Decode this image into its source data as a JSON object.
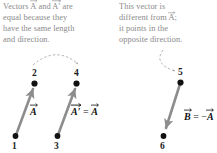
{
  "figure": {
    "background_color": "#ffffff",
    "caption_color": "#8a8a8a",
    "vector_color": "#8d8d8d",
    "dot_color": "#111111",
    "dashed_curve_color": "#9b9b9b"
  },
  "captions": {
    "left": {
      "line1_pre": "Vectors ",
      "line1_vec1": "A",
      "line1_mid": " and ",
      "line1_vec2": "A′",
      "line1_post": " are",
      "line2": "equal because they",
      "line3": "have the same length",
      "line4": "and direction."
    },
    "right": {
      "line1": "This vector is",
      "line2_pre": "different from ",
      "line2_vec": "A",
      "line2_post": ";",
      "line3": "it points in the",
      "line4": "opposite direction."
    }
  },
  "points": {
    "p1": "1",
    "p2": "2",
    "p3": "3",
    "p4": "4",
    "p5": "5",
    "p6": "6"
  },
  "vector_labels": {
    "a": "A",
    "a_prime_pre": "A′",
    "a_prime_eq": " = ",
    "a_prime_post": "A",
    "b_pre": "B",
    "b_eq": " = −",
    "b_post": "A"
  }
}
